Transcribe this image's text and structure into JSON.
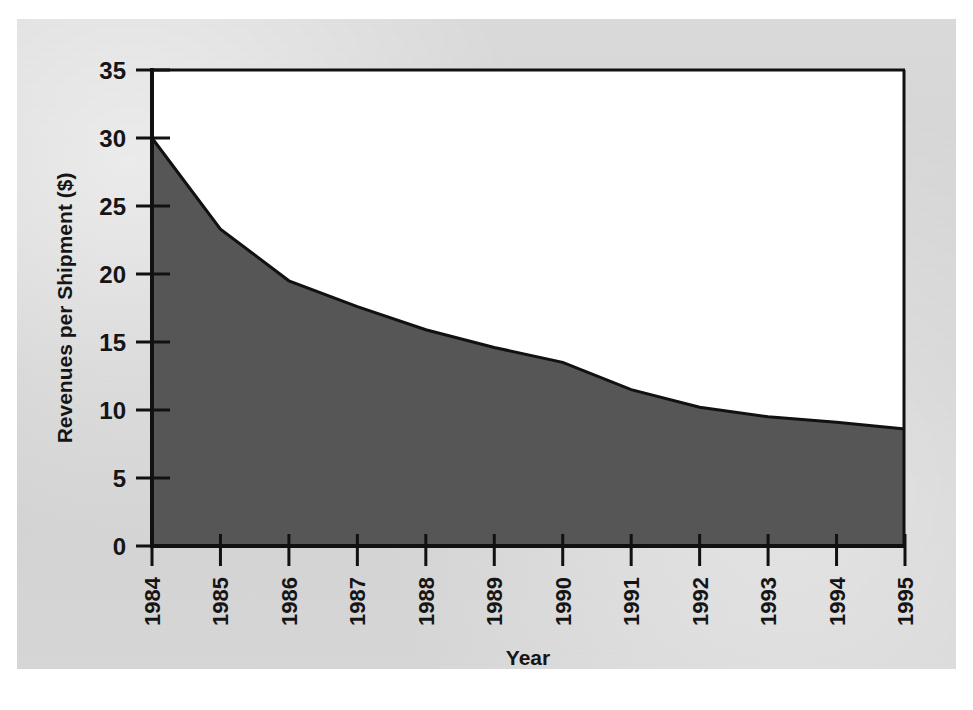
{
  "figure": {
    "background_color": "#d5d5d5",
    "plot_background_color": "#ffffff",
    "area_fill_color": "#565656",
    "line_color": "#111111"
  },
  "chart_data": {
    "type": "area",
    "title": "",
    "xlabel": "Year",
    "ylabel": "Revenues per Shipment ($)",
    "categories": [
      "1984",
      "1985",
      "1986",
      "1987",
      "1988",
      "1989",
      "1990",
      "1991",
      "1992",
      "1993",
      "1994",
      "1995"
    ],
    "values": [
      30.0,
      23.3,
      19.5,
      17.6,
      15.9,
      14.6,
      13.5,
      11.5,
      10.2,
      9.5,
      9.1,
      8.6
    ],
    "series": [
      {
        "name": "Revenues per Shipment ($)",
        "values": [
          30.0,
          23.3,
          19.5,
          17.6,
          15.9,
          14.6,
          13.5,
          11.5,
          10.2,
          9.5,
          9.1,
          8.6
        ]
      }
    ],
    "ylim": [
      0,
      35
    ],
    "yticks": [
      0,
      5,
      10,
      15,
      20,
      25,
      30,
      35
    ],
    "ytick_labels": [
      "0",
      "5",
      "10",
      "15",
      "20",
      "25",
      "30",
      "35"
    ],
    "xtick_labels": [
      "1984",
      "1985",
      "1986",
      "1987",
      "1988",
      "1989",
      "1990",
      "1991",
      "1992",
      "1993",
      "1994",
      "1995"
    ],
    "xtick_rotation": 90,
    "grid": false,
    "legend": false,
    "legend_position": "none"
  }
}
